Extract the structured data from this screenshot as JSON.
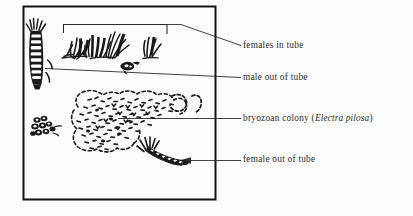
{
  "figure": {
    "kind": "scientific-line-drawing",
    "caption_labels": [
      {
        "id": "females-in-tube",
        "text": "females in tube"
      },
      {
        "id": "male-out-of-tube",
        "text": "male out of tube"
      },
      {
        "id": "bryozoan-colony",
        "text_prefix": "bryozoan colony (",
        "species": "Electra pilosa",
        "text_suffix": ")"
      },
      {
        "id": "female-out-of-tube",
        "text": "female out of tube"
      }
    ],
    "colors": {
      "ink": "#1a1a1a",
      "leader_line": "#2b2b2b",
      "text": "#2b2b2b",
      "background": "#fdfdfb",
      "frame": "#111111"
    },
    "frame": {
      "x": 23,
      "y": 6,
      "width": 193,
      "height": 194,
      "stroke_width": 2
    },
    "subjects": [
      {
        "name": "male-worm-out-of-tube",
        "description": "vertical segmented polychaete worm with bristly head tufts at upper left"
      },
      {
        "name": "female-tube-cluster",
        "description": "tufts of grass-like worm tubes across the upper area"
      },
      {
        "name": "bryozoan-colony",
        "description": "stippled dashed irregular encrusting colony mass in the centre"
      },
      {
        "name": "female-worm-out-of-tube",
        "description": "diagonal segmented worm with head bristles at lower middle"
      },
      {
        "name": "small-dark-cluster",
        "description": "small dark clustered organism at middle left"
      },
      {
        "name": "small-creature",
        "description": "small dark creature below the tube tufts"
      }
    ],
    "bracket": {
      "x_start": 63,
      "x_end": 167,
      "y": 24,
      "tick_depth": 8
    }
  }
}
